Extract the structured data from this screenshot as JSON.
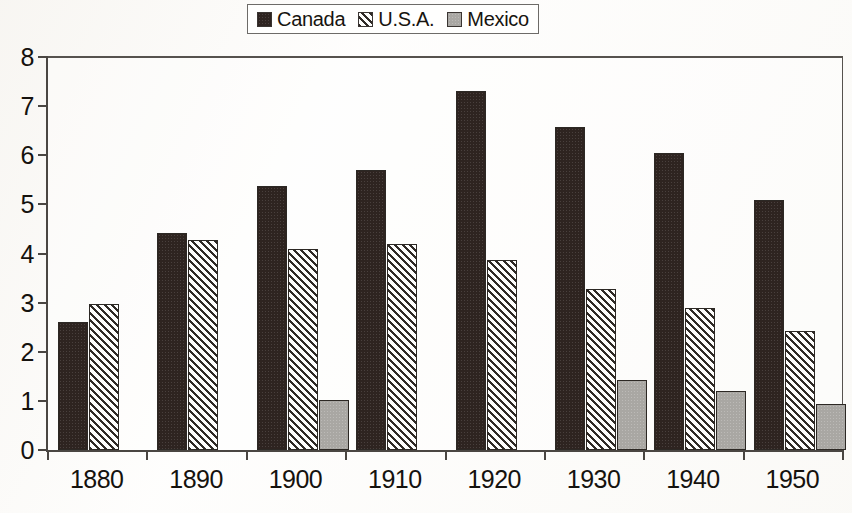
{
  "legend": {
    "items": [
      {
        "label": "Canada",
        "swatch": "legend-swatch-canada",
        "color": "#2e2420"
      },
      {
        "label": "U.S.A.",
        "swatch": "legend-swatch-usa",
        "color": "#ffffff"
      },
      {
        "label": "Mexico",
        "swatch": "legend-swatch-mexico",
        "color": "#a9a7a3"
      }
    ]
  },
  "chart_data": {
    "type": "bar",
    "title": "",
    "xlabel": "",
    "ylabel": "",
    "ylim": [
      0,
      8
    ],
    "yticks": [
      0,
      1,
      2,
      3,
      4,
      5,
      6,
      7,
      8
    ],
    "grid": false,
    "legend_position": "top-center",
    "categories": [
      "1880",
      "1890",
      "1900",
      "1910",
      "1920",
      "1930",
      "1940",
      "1950"
    ],
    "series": [
      {
        "name": "Canada",
        "color": "#2e2420",
        "fill": "solid-dark",
        "values": [
          2.6,
          4.42,
          5.38,
          5.71,
          7.31,
          6.57,
          6.04,
          5.08
        ]
      },
      {
        "name": "U.S.A.",
        "color": "#ffffff",
        "fill": "diagonal-hatch",
        "values": [
          2.97,
          4.27,
          4.1,
          4.2,
          3.87,
          3.28,
          2.9,
          2.42
        ]
      },
      {
        "name": "Mexico",
        "color": "#a9a7a3",
        "fill": "solid-grey",
        "values": [
          null,
          null,
          1.01,
          null,
          null,
          1.42,
          1.2,
          0.94
        ]
      }
    ]
  }
}
